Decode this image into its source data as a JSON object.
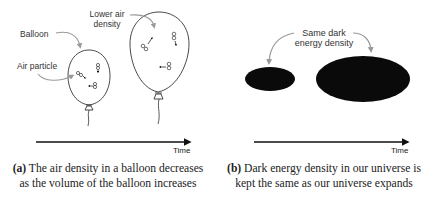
{
  "panel_a": {
    "labels": {
      "balloon": "Balloon",
      "air_particle": "Air particle",
      "lower_air_density_line1": "Lower air",
      "lower_air_density_line2": "density"
    },
    "axis_label": "Time",
    "caption_tag": "(a)",
    "caption_text": " The air density in a balloon decreases as the volume of the balloon increases"
  },
  "panel_b": {
    "labels": {
      "same_dark_line1": "Same dark",
      "same_dark_line2": "energy density"
    },
    "axis_label": "Time",
    "caption_tag": "(b)",
    "caption_text": " Dark energy density in our universe is kept the same as our universe expands"
  },
  "colors": {
    "ink": "#222222",
    "arrow_gray": "#999999",
    "fill_dark": "#0a0a0a"
  }
}
